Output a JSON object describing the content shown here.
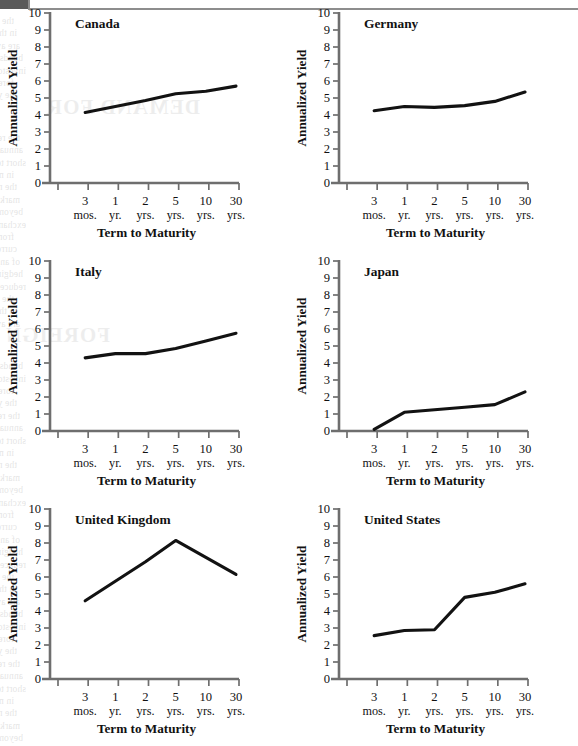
{
  "page": {
    "background_color": "#ffffff",
    "rule_color": "#8d8d8d",
    "edge_bar_color": "#5a5a5a"
  },
  "style": {
    "axis_color": "#6e6e6e",
    "line_color": "#121212"
  },
  "shared": {
    "ylabel": "Annualized Yield",
    "xlabel": "Term to Maturity",
    "ytick_labels": [
      "0",
      "1",
      "2",
      "3",
      "4",
      "5",
      "6",
      "7",
      "8",
      "9",
      "10"
    ],
    "xtick_numbers": [
      "3",
      "1",
      "2",
      "5",
      "10",
      "30"
    ],
    "xtick_units": [
      "mos.",
      "yr.",
      "yrs.",
      "yrs.",
      "yrs.",
      "yrs."
    ],
    "ylim": [
      0,
      10
    ],
    "categories": [
      "3 mos.",
      "1 yr.",
      "2 yrs.",
      "5 yrs.",
      "10 yrs.",
      "30 yrs."
    ]
  },
  "chart_data": [
    {
      "type": "line",
      "title": "Canada",
      "xlabel": "Term to Maturity",
      "ylabel": "Annualized Yield",
      "categories": [
        "3 mos.",
        "1 yr.",
        "2 yrs.",
        "5 yrs.",
        "10 yrs.",
        "30 yrs."
      ],
      "values": [
        4.15,
        4.5,
        4.85,
        5.25,
        5.4,
        5.7
      ],
      "ylim": [
        0,
        10
      ],
      "grid": false,
      "legend": "none"
    },
    {
      "type": "line",
      "title": "Germany",
      "xlabel": "Term to Maturity",
      "ylabel": "Annualized Yield",
      "categories": [
        "3 mos.",
        "1 yr.",
        "2 yrs.",
        "5 yrs.",
        "10 yrs.",
        "30 yrs."
      ],
      "values": [
        4.25,
        4.5,
        4.45,
        4.55,
        4.8,
        5.35
      ],
      "ylim": [
        0,
        10
      ],
      "grid": false,
      "legend": "none"
    },
    {
      "type": "line",
      "title": "Italy",
      "xlabel": "Term to Maturity",
      "ylabel": "Annualized Yield",
      "categories": [
        "3 mos.",
        "1 yr.",
        "2 yrs.",
        "5 yrs.",
        "10 yrs.",
        "30 yrs."
      ],
      "values": [
        4.3,
        4.55,
        4.55,
        4.85,
        5.3,
        5.75
      ],
      "ylim": [
        0,
        10
      ],
      "grid": false,
      "legend": "none"
    },
    {
      "type": "line",
      "title": "Japan",
      "xlabel": "Term to Maturity",
      "ylabel": "Annualized Yield",
      "categories": [
        "3 mos.",
        "1 yr.",
        "2 yrs.",
        "5 yrs.",
        "10 yrs.",
        "30 yrs."
      ],
      "values": [
        0.1,
        1.1,
        1.25,
        1.4,
        1.55,
        2.3
      ],
      "ylim": [
        0,
        10
      ],
      "grid": false,
      "legend": "none"
    },
    {
      "type": "line",
      "title": "United Kingdom",
      "xlabel": "Term to Maturity",
      "ylabel": "Annualized Yield",
      "categories": [
        "3 mos.",
        "1 yr.",
        "2 yrs.",
        "5 yrs.",
        "10 yrs.",
        "30 yrs."
      ],
      "values": [
        4.6,
        5.75,
        6.9,
        8.15,
        7.15,
        6.15
      ],
      "ylim": [
        0,
        10
      ],
      "grid": false,
      "legend": "none"
    },
    {
      "type": "line",
      "title": "United States",
      "xlabel": "Term to Maturity",
      "ylabel": "Annualized Yield",
      "categories": [
        "3 mos.",
        "1 yr.",
        "2 yrs.",
        "5 yrs.",
        "10 yrs.",
        "30 yrs."
      ],
      "values": [
        2.55,
        2.85,
        2.9,
        4.8,
        5.1,
        5.6
      ],
      "ylim": [
        0,
        10
      ],
      "grid": false,
      "legend": "none"
    }
  ],
  "ghost_text": {
    "heading_left": "DEMAND FOR",
    "heading_right": "FOREIGN BONDS",
    "lines": [
      "the relation between interest rates and bond prices",
      "in the market for government securities abroad",
      "are available to investors who purchase foreign",
      "bonds issued in their own national currency",
      "investors may hold bonds denominated in a",
      "foreign currency and receive coupon payments",
      "the yield curve for each national market shows",
      "the relationship between term to maturity and",
      "annualized yield across six major economies",
      "short term rates remain below long term rates",
      "in most markets reflecting normal expectations",
      "the notable exception appears in the sterling",
      "market where inverted segments are visible",
      "beyond the five year point on the curve",
      "exchange rate movements may add to or subtract",
      "from the total return earned by the investor",
      "currency risk is therefore an essential element",
      "of any international fixed income portfolio",
      "hedging strategies using forward contracts can",
      "reduce but not eliminate this form of exposure"
    ]
  }
}
